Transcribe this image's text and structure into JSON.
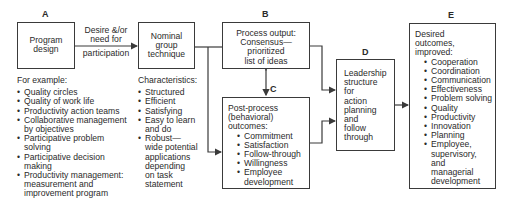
{
  "labels": {
    "a": "A",
    "b": "B",
    "c": "C",
    "d": "D",
    "e": "E"
  },
  "box_a": {
    "text": [
      "Program",
      "design"
    ]
  },
  "arrow_ab": {
    "text": [
      "Desire &/or",
      "need for",
      "participation"
    ]
  },
  "box_nominal": {
    "text": [
      "Nominal",
      "group",
      "technique"
    ]
  },
  "examples": {
    "heading": "For example:",
    "items": [
      [
        "Quality circles"
      ],
      [
        "Quality of work life"
      ],
      [
        "Productivity action teams"
      ],
      [
        "Collaborative management",
        "by objectives"
      ],
      [
        "Participative problem",
        "solving"
      ],
      [
        "Participative decision",
        "making"
      ],
      [
        "Productivity management:",
        "measurement and",
        "improvement program"
      ]
    ]
  },
  "characteristics": {
    "heading": "Characteristics:",
    "items": [
      [
        "Structured"
      ],
      [
        "Efficient"
      ],
      [
        "Satisfying"
      ],
      [
        "Easy to learn",
        "and do"
      ],
      [
        "Robust—",
        "wide potential",
        "applications",
        "depending",
        "on task",
        "statement"
      ]
    ]
  },
  "box_b": {
    "text": [
      "Process output:",
      "Consensus—",
      "prioritized",
      "list of ideas"
    ]
  },
  "box_c": {
    "heading": [
      "Post-process",
      "(behavioral)",
      "outcomes:"
    ],
    "items": [
      [
        "Commitment"
      ],
      [
        "Satisfaction"
      ],
      [
        "Follow-through"
      ],
      [
        "Willingness"
      ],
      [
        "Employee",
        "development"
      ]
    ]
  },
  "box_d": {
    "text": [
      "Leadership",
      "structure",
      "for",
      "action",
      "planning",
      "and",
      "follow",
      "through"
    ]
  },
  "box_e": {
    "heading": [
      "Desired",
      "outcomes,",
      "improved:"
    ],
    "items": [
      [
        "Cooperation"
      ],
      [
        "Coordination"
      ],
      [
        "Communication"
      ],
      [
        "Effectiveness"
      ],
      [
        "Problem solving"
      ],
      [
        "Quality"
      ],
      [
        "Productivity"
      ],
      [
        "Innovation"
      ],
      [
        "Planning"
      ],
      [
        "Employee,",
        "supervisory,",
        "and",
        "managerial",
        "development"
      ]
    ]
  },
  "colors": {
    "line": "#3a3a3a",
    "text": "#2a2a2a",
    "background": "#ffffff"
  }
}
